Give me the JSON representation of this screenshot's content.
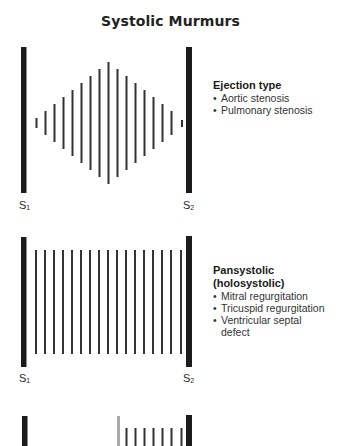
{
  "title": "Systolic Murmurs",
  "colors": {
    "bar": "#1c1c1c",
    "thin_bar": "#333333",
    "gray_bar": "#a8a8a8"
  },
  "panels": [
    {
      "type": "ejection",
      "heading": "Ejection type",
      "items": [
        "Aortic stenosis",
        "Pulmonary stenosis"
      ],
      "s1_label": "S",
      "s1_sub": "1",
      "s2_label": "S",
      "s2_sub": "2",
      "shape": "crescendo-decrescendo (diamond)"
    },
    {
      "type": "pansystolic",
      "heading_line1": "Pansystolic",
      "heading_line2": "(holosystolic)",
      "items": [
        "Mitral regurgitation",
        "Tricuspid regurgitation",
        "Ventricular septal defect"
      ],
      "s1_label": "S",
      "s1_sub": "1",
      "s2_label": "S",
      "s2_sub": "2",
      "shape": "plateau"
    },
    {
      "type": "late-systolic (partial, cut off)",
      "shape": "gray click followed by plateau"
    }
  ]
}
